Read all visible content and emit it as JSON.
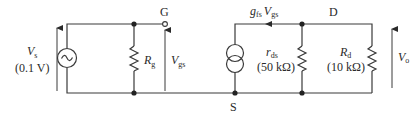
{
  "diagram": {
    "type": "small-signal equivalent circuit (FET amplifier)",
    "source": {
      "symbol": "V",
      "subscript": "s",
      "value": "(0.1 V)"
    },
    "gate_resistor": {
      "symbol": "R",
      "subscript": "g"
    },
    "gate_terminal": "G",
    "gate_source_voltage": {
      "symbol": "V",
      "subscript": "gs"
    },
    "current_source": {
      "g": "g",
      "g_sub": "fs",
      "v": "V",
      "v_sub": "gs"
    },
    "source_terminal": "S",
    "drain_terminal": "D",
    "drain_resistance": {
      "symbol": "r",
      "subscript": "ds",
      "value": "(50 kΩ)"
    },
    "drain_load": {
      "symbol": "R",
      "subscript": "d",
      "value": "(10 kΩ)"
    },
    "output_voltage": {
      "symbol": "V",
      "subscript": "o"
    }
  }
}
